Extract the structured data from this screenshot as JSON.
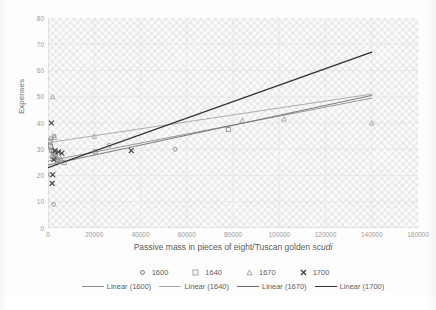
{
  "chart_data": {
    "type": "scatter",
    "title": "",
    "xlabel": "Passive mass in pieces of eight/Tuscan golden scudi",
    "xlabel_plain": "Passive mass in pieces of eight/Tuscan golden ",
    "xlabel_italic": "scudi",
    "ylabel": "Expenses",
    "xlim": [
      0,
      160000
    ],
    "ylim": [
      0,
      80
    ],
    "xticks": [
      0,
      20000,
      40000,
      60000,
      80000,
      100000,
      120000,
      140000,
      160000
    ],
    "xtick_labels": [
      "0",
      "20000",
      "40000",
      "60000",
      "80000",
      "100000",
      "120000",
      "140000",
      "160000"
    ],
    "yticks": [
      0,
      10,
      20,
      30,
      40,
      50,
      60,
      70,
      80
    ],
    "ytick_labels": [
      "0",
      "10",
      "20",
      "30",
      "40",
      "50",
      "60",
      "70",
      "80"
    ],
    "grid": true,
    "legend_position": "bottom",
    "series": [
      {
        "name": "1600",
        "marker": "circle",
        "color": "#7b7b7b",
        "points": [
          [
            1200,
            34.0
          ],
          [
            2600,
            35.0
          ],
          [
            1500,
            30.5
          ],
          [
            2100,
            29.0
          ],
          [
            3400,
            28.0
          ],
          [
            1800,
            27.0
          ],
          [
            2900,
            26.5
          ],
          [
            4200,
            26.0
          ],
          [
            1000,
            20.3
          ],
          [
            2400,
            9.0
          ],
          [
            55000,
            30.0
          ],
          [
            26500,
            31.5
          ]
        ]
      },
      {
        "name": "1640",
        "marker": "square",
        "color": "#8a8a8a",
        "points": [
          [
            900,
            33.0
          ],
          [
            1100,
            31.0
          ],
          [
            1600,
            29.5
          ],
          [
            2300,
            28.5
          ],
          [
            3000,
            27.5
          ],
          [
            4000,
            26.0
          ],
          [
            5200,
            25.5
          ],
          [
            7000,
            25.0
          ],
          [
            20500,
            29.0
          ],
          [
            78000,
            37.5
          ]
        ]
      },
      {
        "name": "1670",
        "marker": "triangle",
        "color": "#9a9a9a",
        "points": [
          [
            2000,
            50.0
          ],
          [
            2800,
            34.5
          ],
          [
            20000,
            35.0
          ],
          [
            3500,
            27.5
          ],
          [
            5500,
            26.5
          ],
          [
            84000,
            41.0
          ],
          [
            102000,
            41.5
          ],
          [
            140000,
            40.0
          ]
        ]
      },
      {
        "name": "1700",
        "marker": "cross",
        "color": "#4a4a4a",
        "points": [
          [
            1500,
            40.0
          ],
          [
            3000,
            29.5
          ],
          [
            4500,
            29.0
          ],
          [
            6000,
            28.5
          ],
          [
            2500,
            26.0
          ],
          [
            2100,
            20.3
          ],
          [
            1800,
            17.0
          ],
          [
            36000,
            29.5
          ]
        ]
      }
    ],
    "trendlines": [
      {
        "name": "Linear (1600)",
        "color": "#8c8c8c",
        "width": 0.9,
        "x0": 0,
        "y0": 25.5,
        "x1": 140000,
        "y1": 49.5
      },
      {
        "name": "Linear (1640)",
        "color": "#a5a5a5",
        "width": 0.9,
        "x0": 0,
        "y0": 32.5,
        "x1": 140000,
        "y1": 51.0
      },
      {
        "name": "Linear (1670)",
        "color": "#6e6e6e",
        "width": 0.9,
        "x0": 0,
        "y0": 24.0,
        "x1": 140000,
        "y1": 50.5
      },
      {
        "name": "Linear (1700)",
        "color": "#2f2f2f",
        "width": 1.3,
        "x0": 0,
        "y0": 23.0,
        "x1": 140000,
        "y1": 67.0
      }
    ]
  },
  "legend": {
    "markers": [
      {
        "label": "1600",
        "marker": "circle"
      },
      {
        "label": "1640",
        "marker": "square"
      },
      {
        "label": "1670",
        "marker": "triangle"
      },
      {
        "label": "1700",
        "marker": "cross"
      }
    ],
    "lines": [
      {
        "label": "Linear (1600)"
      },
      {
        "label": "Linear (1640)"
      },
      {
        "label": "Linear (1670)"
      },
      {
        "label": "Linear (1700)"
      }
    ]
  }
}
